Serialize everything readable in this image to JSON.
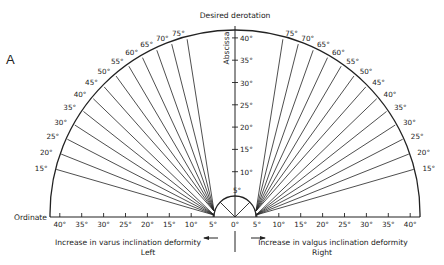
{
  "figure": {
    "panel_label": "A",
    "top_title": "Desired derotation",
    "vertical_axis_label": "Abscissa",
    "horizontal_axis_label": "Ordinate",
    "left_caption": "Increase in varus inclination deformity",
    "left_side": "Left",
    "right_caption": "Increase in valgus inclination deformity",
    "right_side": "Right",
    "arc_labels_left": [
      "15°",
      "20°",
      "25°",
      "30°",
      "35°",
      "40°",
      "45°",
      "50°",
      "55°",
      "60°",
      "65°",
      "70°",
      "75°"
    ],
    "arc_labels_right": [
      "75°",
      "70°",
      "65°",
      "60°",
      "55°",
      "50°",
      "45°",
      "40°",
      "35°",
      "30°",
      "25°",
      "20°",
      "15°"
    ],
    "vertical_ticks": [
      "5°",
      "10°",
      "15°",
      "20°",
      "25°",
      "30°",
      "35°",
      "40°"
    ],
    "horizontal_ticks_left": [
      "40°",
      "35°",
      "30°",
      "25°",
      "20°",
      "15°",
      "10°",
      "5°"
    ],
    "horizontal_ticks_right": [
      "5°",
      "10°",
      "15°",
      "20°",
      "25°",
      "30°",
      "35°",
      "40°"
    ],
    "center_tick": "0°",
    "line_color": "#222222",
    "background": "#ffffff"
  }
}
